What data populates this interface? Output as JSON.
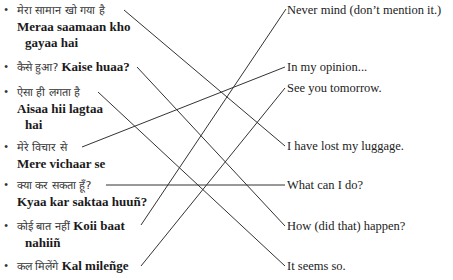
{
  "exercise": {
    "left_items": [
      {
        "hindi": "मेरा सामान खो गया है",
        "translit_line1": "Meraa saamaan kho",
        "translit_line2": "gayaa hai"
      },
      {
        "hindi": "कैसे हुआ?",
        "translit_line1": "Kaise huaa?"
      },
      {
        "hindi": "ऐसा ही लगता है",
        "translit_line1": "Aisaa hii lagtaa",
        "translit_line2": "hai"
      },
      {
        "hindi": "मेरे विचार से",
        "translit_line1": "Mere vichaar se"
      },
      {
        "hindi": "क्या कर सकता हूँ?",
        "translit_line1": "Kyaa kar saktaa huuñ?"
      },
      {
        "hindi": "कोई बात नहीं",
        "translit_line1": "Koii baat",
        "translit_line2": "nahiiñ"
      },
      {
        "hindi": "कल मिलेंगे",
        "translit_line1": "Kal mileñge"
      }
    ],
    "right_items": [
      "Never mind (don’t mention it.)",
      "In my opinion...",
      "See you tomorrow.",
      "I have lost my luggage.",
      "What can I do?",
      "How (did that) happen?",
      "It seems so."
    ],
    "matches": [
      {
        "from": 0,
        "to": 3
      },
      {
        "from": 1,
        "to": 5
      },
      {
        "from": 2,
        "to": 6
      },
      {
        "from": 3,
        "to": 1
      },
      {
        "from": 4,
        "to": 4
      },
      {
        "from": 5,
        "to": 0
      },
      {
        "from": 6,
        "to": 2
      }
    ],
    "line_color": "#333333"
  }
}
